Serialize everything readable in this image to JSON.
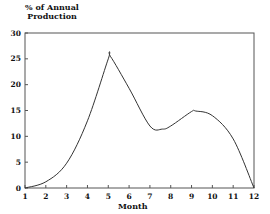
{
  "chart_data": {
    "type": "line",
    "title": "",
    "xlabel": "Month",
    "ylabel": "% of Annual Production",
    "ylabel_lines": [
      "% of Annual",
      "Production"
    ],
    "xlim": [
      1,
      12
    ],
    "ylim": [
      0,
      30
    ],
    "xticks": [
      1,
      2,
      3,
      4,
      5,
      6,
      7,
      8,
      9,
      10,
      11,
      12
    ],
    "yticks": [
      0,
      5,
      10,
      15,
      20,
      25,
      30
    ],
    "grid": false,
    "legend": null,
    "series": [
      {
        "name": "% of Annual Production",
        "x": [
          1,
          2,
          3,
          4,
          5,
          5.1,
          6,
          7,
          7.6,
          8,
          9,
          9.2,
          10,
          11,
          12
        ],
        "values": [
          0,
          1.2,
          4.8,
          13,
          25,
          25.5,
          19.3,
          12,
          11.4,
          12,
          14.8,
          14.9,
          14,
          9.5,
          0
        ]
      }
    ]
  }
}
